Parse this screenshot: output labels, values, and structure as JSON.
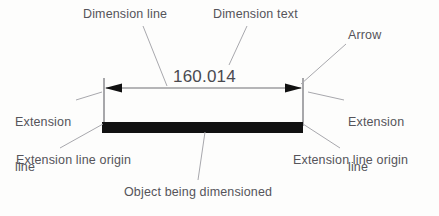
{
  "figure": {
    "type": "technical-drawing-diagram",
    "background_color": "#fdfdfc",
    "label_color": "#55545a",
    "line_color": "#6e6e73",
    "object_color": "#111111"
  },
  "dimension": {
    "value_text": "160.014",
    "unit": "",
    "arrow_style": "filled-solid",
    "dimension_line_y": 88,
    "extension_line_left_x": 104,
    "extension_line_right_x": 303
  },
  "labels": {
    "dimension_line": "Dimension line",
    "dimension_text": "Dimension text",
    "arrow": "Arrow",
    "extension_line_left_1": "Extension",
    "extension_line_left_2": "line",
    "extension_line_right_1": "Extension",
    "extension_line_right_2": "line",
    "extension_line_origin_left": "Extension line origin",
    "extension_line_origin_right": "Extension line origin",
    "object_being_dimensioned": "Object being dimensioned"
  },
  "object_bar": {
    "x": 102,
    "y": 122,
    "width": 201,
    "height": 11,
    "fill": "#111111"
  },
  "leaders": [
    {
      "name": "dimension-line-leader",
      "x1": 143,
      "y1": 26,
      "x2": 167,
      "y2": 86
    },
    {
      "name": "dimension-text-leader",
      "x1": 247,
      "y1": 26,
      "x2": 229,
      "y2": 65
    },
    {
      "name": "arrow-leader",
      "x1": 346,
      "y1": 44,
      "x2": 301,
      "y2": 84
    },
    {
      "name": "extension-line-left-leader",
      "x1": 76,
      "y1": 100,
      "x2": 102,
      "y2": 92
    },
    {
      "name": "extension-line-right-leader",
      "x1": 344,
      "y1": 100,
      "x2": 308,
      "y2": 92
    },
    {
      "name": "origin-left-leader",
      "x1": 60,
      "y1": 148,
      "x2": 103,
      "y2": 124
    },
    {
      "name": "origin-right-leader",
      "x1": 340,
      "y1": 148,
      "x2": 303,
      "y2": 124
    },
    {
      "name": "object-leader",
      "x1": 198,
      "y1": 180,
      "x2": 205,
      "y2": 132
    }
  ]
}
